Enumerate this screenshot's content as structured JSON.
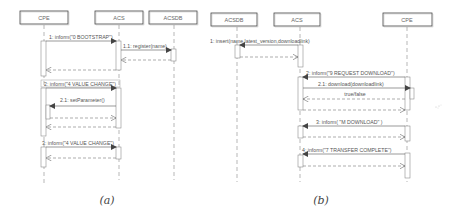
{
  "diagram_a": {
    "caption": "(a)",
    "lifelines": [
      {
        "name": "CPE"
      },
      {
        "name": "ACS"
      },
      {
        "name": "ACSDB"
      }
    ],
    "messages": [
      {
        "label": "1: inform(\"0 BOOTSTRAP\")",
        "from": "CPE",
        "to": "ACS",
        "type": "sync"
      },
      {
        "label": "1.1: register(name)",
        "from": "ACS",
        "to": "ACSDB",
        "type": "sync"
      },
      {
        "label": "",
        "from": "ACSDB",
        "to": "ACS",
        "type": "return"
      },
      {
        "label": "",
        "from": "ACS",
        "to": "CPE",
        "type": "return"
      },
      {
        "label": "2: inform(\"4 VALUE CHANGE\")",
        "from": "CPE",
        "to": "ACS",
        "type": "sync"
      },
      {
        "label": "2.1: setParameter()",
        "from": "ACS",
        "to": "CPE",
        "type": "sync"
      },
      {
        "label": "",
        "from": "CPE",
        "to": "ACS",
        "type": "return"
      },
      {
        "label": "",
        "from": "ACS",
        "to": "CPE",
        "type": "return"
      },
      {
        "label": "3: inform(\"4 VALUE CHANGE\")",
        "from": "CPE",
        "to": "ACS",
        "type": "sync"
      },
      {
        "label": "",
        "from": "ACS",
        "to": "CPE",
        "type": "return"
      }
    ]
  },
  "diagram_b": {
    "caption": "(b)",
    "lifelines": [
      {
        "name": "ACSDB"
      },
      {
        "name": "ACS"
      },
      {
        "name": "CPE"
      }
    ],
    "messages": [
      {
        "label": "1: insert(name,latest_version,downloadlink)",
        "from": "ACS",
        "to": "ACSDB",
        "type": "sync"
      },
      {
        "label": "",
        "from": "ACSDB",
        "to": "ACS",
        "type": "return"
      },
      {
        "label": "2: inform(\"9 REQUEST DOWNLOAD\")",
        "from": "CPE",
        "to": "ACS",
        "type": "sync"
      },
      {
        "label": "2.1: download(downloadlink)",
        "from": "ACS",
        "to": "CPE",
        "type": "sync"
      },
      {
        "label": "true/false",
        "from": "CPE",
        "to": "ACS",
        "type": "return"
      },
      {
        "label": "",
        "from": "ACS",
        "to": "CPE",
        "type": "return"
      },
      {
        "label": "3: inform( \"M DOWNLOAD\" )",
        "from": "CPE",
        "to": "ACS",
        "type": "sync"
      },
      {
        "label": "",
        "from": "ACS",
        "to": "CPE",
        "type": "return"
      },
      {
        "label": "4: inform(\"7 TRANSFER COMPLETE\")",
        "from": "CPE",
        "to": "ACS",
        "type": "sync"
      },
      {
        "label": "",
        "from": "ACS",
        "to": "CPE",
        "type": "return"
      }
    ]
  }
}
